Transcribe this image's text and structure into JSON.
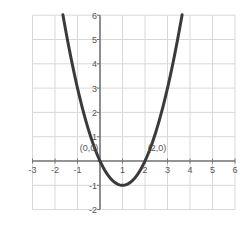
{
  "chart_data": {
    "type": "line",
    "title": "",
    "xlabel": "",
    "ylabel": "",
    "function": "y = x^2 - 2x",
    "xlim": [
      -3,
      6
    ],
    "ylim": [
      -2,
      6
    ],
    "grid": true,
    "x_ticks": [
      "-3",
      "-2",
      "-1",
      "1",
      "2",
      "3",
      "4",
      "5",
      "6"
    ],
    "y_ticks": [
      "-2",
      "-1",
      "1",
      "2",
      "3",
      "4",
      "5",
      "6"
    ],
    "series": [
      {
        "name": "parabola",
        "x": [
          -1.65,
          -1.5,
          -1,
          -0.5,
          0,
          0.5,
          1,
          1.5,
          2,
          2.5,
          3,
          3.5,
          3.65
        ],
        "y": [
          6.0,
          5.25,
          3,
          1.25,
          0,
          -0.75,
          -1,
          -0.75,
          0,
          1.25,
          3,
          5.25,
          6.0
        ]
      }
    ],
    "annotations": [
      {
        "text": "(0,0)",
        "x": 0,
        "y": 0
      },
      {
        "text": "(2,0)",
        "x": 2,
        "y": 0
      }
    ]
  },
  "colors": {
    "curve": "#3a3a3a",
    "axis": "#777777",
    "grid": "#d8d8d8",
    "text": "#555555"
  }
}
